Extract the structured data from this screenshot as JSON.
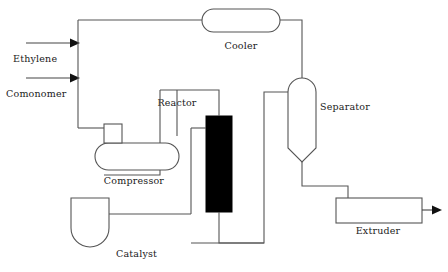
{
  "diagram": {
    "type": "process-flow-diagram",
    "canvas": {
      "width": 448,
      "height": 272
    },
    "colors": {
      "background": "#ffffff",
      "line": "#555555",
      "text": "#1a1a1a",
      "reactor_fill": "#000000",
      "arrow": "#111111"
    },
    "equipment": [
      {
        "id": "cooler",
        "label": "Cooler",
        "shape": "horizontal-stadium",
        "label_x": 241,
        "label_y": 49
      },
      {
        "id": "separator",
        "label": "Separator",
        "shape": "vertical-vessel",
        "label_x": 320,
        "label_y": 110
      },
      {
        "id": "reactor",
        "label": "Reactor",
        "shape": "filled-rectangle",
        "label_x": 177,
        "label_y": 106
      },
      {
        "id": "compressor",
        "label": "Compressor",
        "shape": "horizontal-stadium-with-inlet-box",
        "label_x": 134,
        "label_y": 184
      },
      {
        "id": "catalyst",
        "label": "Catalyst",
        "shape": "u-vessel",
        "label_x": 136,
        "label_y": 257
      },
      {
        "id": "extruder",
        "label": "Extruder",
        "shape": "rectangle",
        "label_x": 378,
        "label_y": 234
      }
    ],
    "streams": [
      {
        "id": "ethylene-feed",
        "label": "Ethylene",
        "label_x": 13,
        "label_y": 62,
        "has_arrow": true
      },
      {
        "id": "comonomer-feed",
        "label": "Comonomer",
        "label_x": 6,
        "label_y": 97,
        "has_arrow": true
      },
      {
        "id": "product-outlet",
        "label": "",
        "has_arrow": true
      }
    ]
  }
}
